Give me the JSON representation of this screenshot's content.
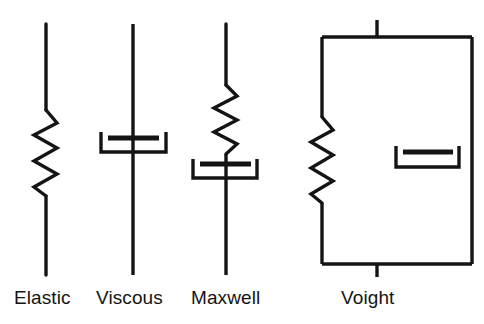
{
  "figure": {
    "background_color": "#ffffff",
    "stroke_color": "#141414",
    "labels": [
      {
        "id": "elastic",
        "text": "Elastic"
      },
      {
        "id": "viscous",
        "text": "Viscous"
      },
      {
        "id": "maxwell",
        "text": "Maxwell"
      },
      {
        "id": "voight",
        "text": "Voight"
      }
    ],
    "elements": [
      {
        "name": "elastic",
        "label": "Elastic",
        "component": "spring",
        "description": "A single spring (Hookean elastic element) drawn as a vertical zigzag with straight leads above and below."
      },
      {
        "name": "viscous",
        "label": "Viscous",
        "component": "dashpot",
        "description": "A single dashpot (Newtonian viscous element) drawn as a U-shaped cylinder with a horizontal piston plate on a vertical rod."
      },
      {
        "name": "maxwell",
        "label": "Maxwell",
        "component": "spring-and-dashpot-in-series",
        "description": "A spring stacked directly above a dashpot on one vertical line (series arrangement)."
      },
      {
        "name": "voight",
        "label": "Voight",
        "component": "spring-and-dashpot-in-parallel",
        "description": "A spring on the left branch and a dashpot on the right branch joined by horizontal rails top and bottom (parallel arrangement), with short stubs at top centre and bottom centre."
      }
    ]
  }
}
